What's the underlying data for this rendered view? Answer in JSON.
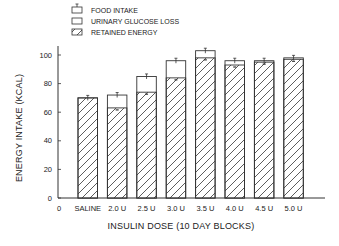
{
  "chart_data": {
    "type": "bar",
    "subtype": "stacked-overlay",
    "title": "",
    "xlabel": "INSULIN DOSE (10 DAY BLOCKS)",
    "ylabel": "ENERGY INTAKE (KCAL)",
    "ylim": [
      0,
      110
    ],
    "yticks": [
      0,
      20,
      40,
      60,
      80,
      100
    ],
    "x_origin_label": "0",
    "grid": false,
    "legend_position": "top-left",
    "categories": [
      "SALINE",
      "2.0 U",
      "2.5 U",
      "3.0 U",
      "3.5 U",
      "4.0 U",
      "4.5 U",
      "5.0 U"
    ],
    "series": [
      {
        "name": "FOOD INTAKE",
        "values": [
          70,
          72,
          85,
          96,
          103,
          96,
          96,
          98
        ],
        "style": "open-with-error-bar"
      },
      {
        "name": "URINARY GLUCOSE LOSS",
        "values": [
          0,
          9,
          11,
          12,
          5,
          3,
          1,
          1
        ],
        "style": "open"
      },
      {
        "name": "RETAINED ENERGY",
        "values": [
          70,
          63,
          74,
          84,
          98,
          93,
          95,
          97
        ],
        "style": "hatched"
      }
    ],
    "legend": [
      {
        "label": "FOOD INTAKE",
        "icon": "open-box-with-errorbar"
      },
      {
        "label": "URINARY GLUCOSE LOSS",
        "icon": "open-box"
      },
      {
        "label": "RETAINED ENERGY",
        "icon": "hatched-box"
      }
    ]
  }
}
